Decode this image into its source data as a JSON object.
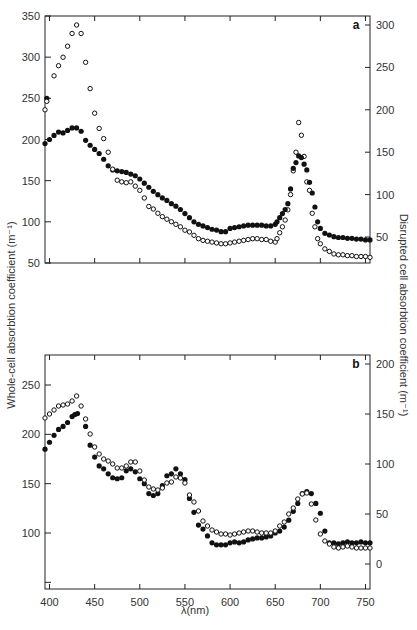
{
  "chart_data": [
    {
      "type": "scatter",
      "panel": "a",
      "panel_label": "a",
      "xlabel": "λ(nm)",
      "ylabel_left": "Whole-cell absorbtion coefficient (m⁻¹)",
      "ylabel_right": "Disrupted cell absorbtion coefficient (m⁻¹)",
      "xlim": [
        395,
        755
      ],
      "ylim_left": [
        50,
        350
      ],
      "ylim_right": [
        19,
        310
      ],
      "left_ticks": [
        50,
        100,
        150,
        200,
        250,
        300,
        350
      ],
      "right_ticks": [
        50,
        100,
        150,
        200,
        250,
        300
      ],
      "x_ticks": [
        400,
        450,
        500,
        550,
        600,
        650,
        700,
        750
      ],
      "series": [
        {
          "name": "Whole cell (filled circles, left axis)",
          "marker": "filled",
          "axis": "left",
          "x": [
            395,
            397,
            400,
            405,
            410,
            415,
            420,
            425,
            430,
            435,
            440,
            445,
            450,
            455,
            460,
            465,
            470,
            475,
            480,
            485,
            490,
            495,
            500,
            505,
            510,
            515,
            520,
            525,
            530,
            535,
            540,
            545,
            550,
            555,
            560,
            565,
            570,
            575,
            580,
            585,
            590,
            595,
            600,
            605,
            610,
            615,
            620,
            625,
            630,
            635,
            640,
            645,
            650
          ],
          "values": [
            195,
            250,
            200,
            205,
            209,
            208,
            211,
            214,
            214,
            210,
            199,
            193,
            188,
            183,
            176,
            168,
            163,
            162,
            161,
            160,
            158,
            156,
            152,
            147,
            142,
            137,
            133,
            129,
            126,
            122,
            119,
            115,
            110,
            105,
            100,
            97,
            95,
            93,
            91,
            90,
            88,
            88,
            92,
            93,
            94,
            95,
            96,
            96,
            96,
            96,
            95,
            95,
            97
          ]
        },
        {
          "name": "Disrupted cell (open circles, right axis)",
          "marker": "open",
          "axis": "right",
          "x": [
            395,
            397,
            405,
            410,
            415,
            420,
            425,
            430,
            435,
            440,
            445,
            450,
            455,
            460,
            465,
            470,
            475,
            480,
            485,
            490,
            495,
            500,
            505,
            510,
            515,
            520,
            525,
            530,
            535,
            540,
            545,
            550,
            555,
            560,
            565,
            570,
            575,
            580,
            585,
            590,
            595,
            600,
            605,
            610,
            615,
            620,
            625,
            630,
            635,
            640,
            645,
            650
          ],
          "values": [
            200,
            210,
            240,
            252,
            262,
            275,
            290,
            300,
            290,
            256,
            225,
            196,
            178,
            166,
            150,
            130,
            117,
            115,
            114,
            115,
            110,
            105,
            96,
            86,
            83,
            78,
            74,
            71,
            68,
            65,
            62,
            58,
            56,
            52,
            48,
            46,
            45,
            44,
            43,
            42,
            42,
            43,
            44,
            45,
            46,
            47,
            48,
            48,
            47,
            47,
            45,
            44
          ]
        }
      ],
      "peak_region": {
        "whole_cell": {
          "x": [
            652,
            655,
            658,
            661,
            664,
            667,
            670,
            673,
            676,
            679,
            682,
            685,
            688,
            691,
            694,
            697,
            700,
            705,
            710,
            715,
            720,
            725,
            730,
            735,
            740,
            745,
            750,
            755
          ],
          "values": [
            100,
            105,
            110,
            115,
            122,
            140,
            165,
            172,
            180,
            178,
            170,
            163,
            148,
            135,
            118,
            100,
            92,
            86,
            84,
            82,
            81,
            81,
            80,
            80,
            79,
            79,
            78,
            78
          ]
        },
        "disrupted_cell": {
          "x": [
            652,
            655,
            658,
            661,
            664,
            667,
            670,
            673,
            676,
            679,
            682,
            685,
            688,
            691,
            694,
            697,
            700,
            705,
            710,
            715,
            720,
            725,
            730,
            735,
            740,
            745,
            750,
            755
          ],
          "values": [
            48,
            55,
            62,
            70,
            82,
            100,
            128,
            150,
            185,
            170,
            145,
            115,
            105,
            78,
            62,
            48,
            42,
            36,
            33,
            30,
            29,
            29,
            28,
            28,
            27,
            27,
            27,
            26
          ]
        }
      }
    },
    {
      "type": "scatter",
      "panel": "b",
      "panel_label": "b",
      "xlabel": "λ(nm)",
      "xlim": [
        395,
        755
      ],
      "ylim_left": [
        40,
        280
      ],
      "ylim_right": [
        -25,
        215
      ],
      "left_ticks": [
        50,
        100,
        150,
        200,
        250
      ],
      "left_tick_labels": [
        "",
        "100",
        "150",
        "200",
        "250"
      ],
      "right_ticks": [
        0,
        50,
        100,
        150,
        200
      ],
      "x_ticks": [
        400,
        450,
        500,
        550,
        600,
        650,
        700,
        750
      ],
      "series": [
        {
          "name": "Whole cell (filled circles, left axis)",
          "marker": "filled",
          "axis": "left",
          "x": [
            395,
            400,
            405,
            410,
            415,
            420,
            425,
            428,
            431,
            440,
            445,
            450,
            455,
            460,
            465,
            470,
            475,
            480,
            485,
            490,
            495,
            500,
            505,
            510,
            515,
            520,
            525,
            530,
            535,
            540,
            545,
            550,
            555,
            560,
            565,
            570,
            575,
            580,
            585,
            590,
            595,
            600,
            605,
            610,
            615,
            620,
            625,
            630,
            635,
            640,
            645,
            650,
            655,
            660,
            665,
            670,
            675,
            680,
            685,
            690,
            695,
            700,
            705,
            710,
            715,
            720,
            725,
            730,
            735,
            740,
            745,
            750,
            755
          ],
          "values": [
            185,
            192,
            199,
            205,
            208,
            212,
            218,
            220,
            221,
            208,
            189,
            177,
            168,
            165,
            160,
            156,
            155,
            156,
            163,
            165,
            162,
            155,
            150,
            140,
            138,
            140,
            148,
            158,
            160,
            165,
            160,
            154,
            135,
            121,
            108,
            104,
            97,
            90,
            88,
            88,
            88,
            90,
            91,
            90,
            91,
            93,
            94,
            95,
            95,
            96,
            97,
            100,
            102,
            106,
            113,
            122,
            130,
            140,
            142,
            140,
            130,
            120,
            102,
            90,
            90,
            89,
            90,
            91,
            90,
            90,
            91,
            90,
            90
          ]
        },
        {
          "name": "Disrupted cell (open circles, right axis)",
          "marker": "open",
          "axis": "right",
          "x": [
            395,
            400,
            405,
            410,
            415,
            420,
            425,
            430,
            435,
            440,
            445,
            450,
            455,
            460,
            465,
            470,
            475,
            480,
            485,
            490,
            495,
            500,
            505,
            510,
            515,
            520,
            525,
            530,
            535,
            540,
            545,
            550,
            555,
            560,
            565,
            570,
            575,
            580,
            585,
            590,
            595,
            600,
            605,
            610,
            615,
            620,
            625,
            630,
            635,
            640,
            645,
            650,
            655,
            660,
            665,
            670,
            675,
            680,
            685,
            690,
            695,
            700,
            705,
            710,
            715,
            720,
            725,
            730,
            735,
            740,
            745,
            750,
            755
          ],
          "values": [
            146,
            150,
            154,
            158,
            159,
            160,
            163,
            168,
            158,
            145,
            130,
            117,
            110,
            105,
            103,
            100,
            96,
            96,
            98,
            102,
            102,
            93,
            84,
            77,
            75,
            74,
            76,
            81,
            82,
            87,
            86,
            81,
            69,
            62,
            53,
            43,
            38,
            34,
            32,
            30,
            30,
            29,
            30,
            31,
            32,
            33,
            33,
            32,
            31,
            31,
            31,
            33,
            38,
            42,
            50,
            56,
            65,
            70,
            71,
            60,
            44,
            30,
            23,
            20,
            17,
            16,
            17,
            18,
            17,
            16,
            16,
            16,
            16
          ]
        }
      ]
    }
  ],
  "labels": {
    "panel_a": "a",
    "panel_b": "b",
    "x_axis_title": "λ(nm)",
    "left_axis_title": "Whole-cell absorbtion coefficient (m⁻¹)",
    "right_axis_title": "Disrupted cell absorbtion coefficient (m⁻¹)"
  }
}
